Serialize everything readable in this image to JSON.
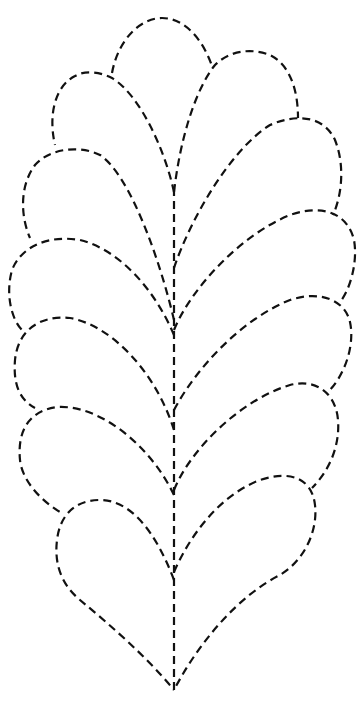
{
  "figure": {
    "subject": "feather quilting stencil",
    "line_style": "dashed",
    "stroke_color": "#111111",
    "background_color": "#ffffff",
    "plumes_left": 6,
    "plumes_right": 6,
    "top_plume": 1
  }
}
